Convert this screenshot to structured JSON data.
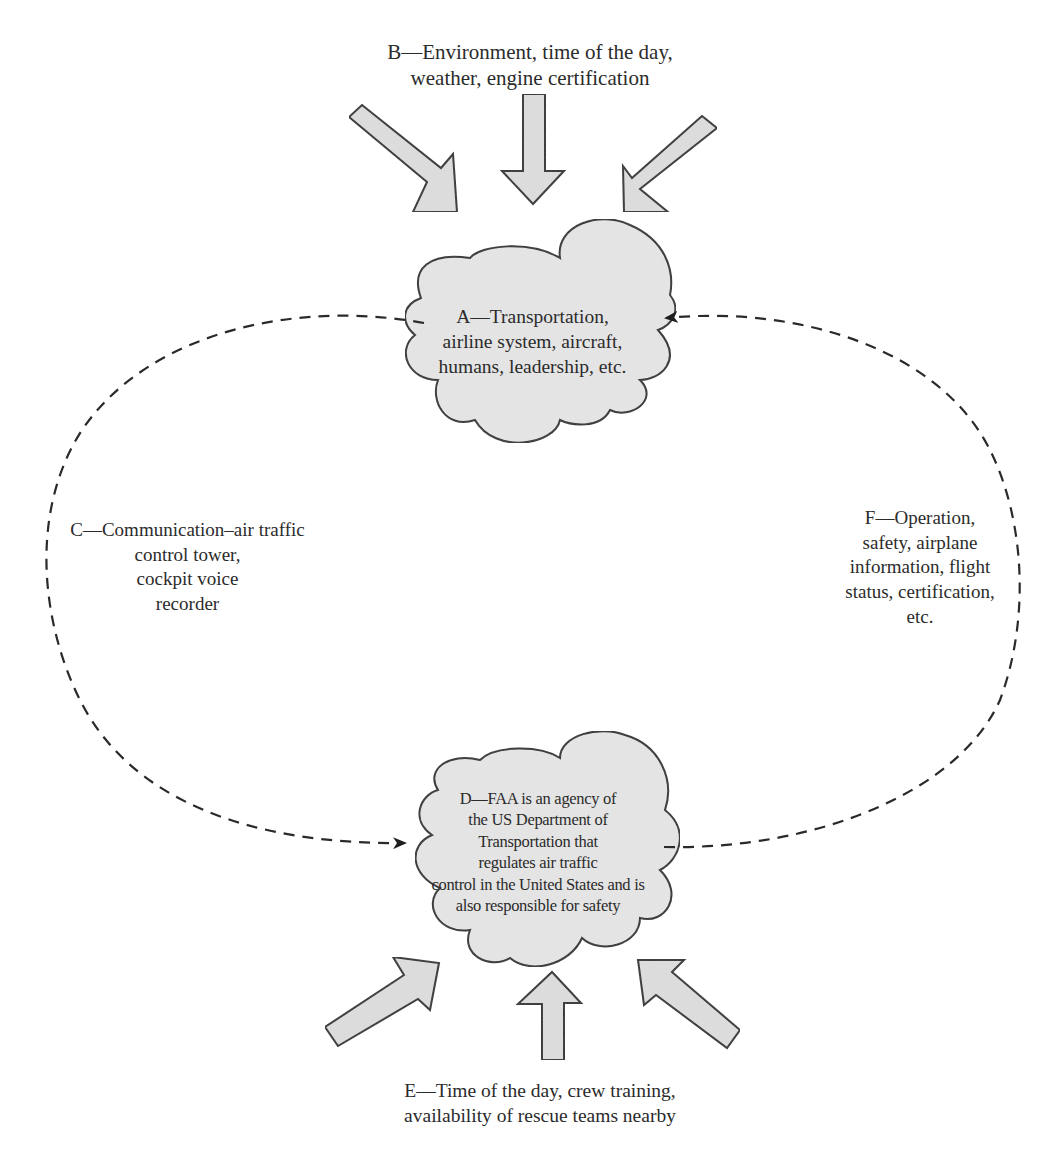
{
  "diagram": {
    "type": "cause-effect cycle diagram",
    "nodes": {
      "A": {
        "id": "A",
        "shape": "cloud",
        "lines": [
          "A—Transportation,",
          "airline system, aircraft,",
          "humans, leadership, etc."
        ]
      },
      "B": {
        "id": "B",
        "shape": "label with three inward arrows",
        "lines": [
          "B—Environment, time of the day,",
          "weather, engine certification"
        ]
      },
      "C": {
        "id": "C",
        "shape": "label on dashed arc",
        "lines": [
          "C—Communication–air traffic",
          "control tower,",
          "cockpit voice",
          "recorder"
        ]
      },
      "D": {
        "id": "D",
        "shape": "cloud",
        "lines": [
          "D—FAA is an agency of",
          "the US Department of",
          "Transportation that",
          "regulates air traffic",
          "control in the United States and is",
          "also responsible for safety"
        ]
      },
      "E": {
        "id": "E",
        "shape": "label with three inward arrows",
        "lines": [
          "E—Time of the day, crew training,",
          "availability of rescue teams nearby"
        ]
      },
      "F": {
        "id": "F",
        "shape": "label on dashed arc",
        "lines": [
          "F—Operation,",
          "safety, airplane",
          "information, flight",
          "status, certification,",
          "etc."
        ]
      }
    },
    "edges": [
      {
        "from": "A",
        "to": "D",
        "via": "C",
        "style": "dashed",
        "side": "left"
      },
      {
        "from": "D",
        "to": "A",
        "via": "F",
        "style": "dashed",
        "side": "right"
      },
      {
        "from": "B",
        "to": "A",
        "style": "block arrows",
        "count": 3
      },
      {
        "from": "E",
        "to": "D",
        "style": "block arrows",
        "count": 3
      }
    ],
    "colors": {
      "cloud_fill": "#e6e6e6",
      "arrow_fill": "#dedede",
      "stroke": "#333333",
      "dash": "#2a2a2a",
      "background": "#ffffff"
    }
  }
}
